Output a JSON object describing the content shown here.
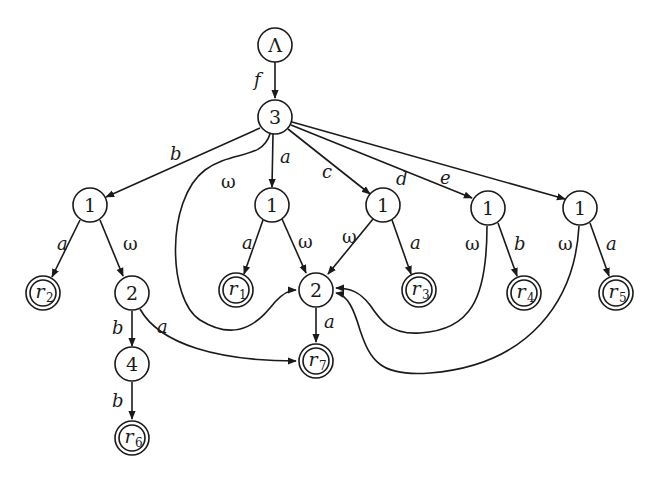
{
  "diagram": {
    "type": "automaton-tree",
    "nodes": [
      {
        "id": "root",
        "label": "Λ",
        "x": 275,
        "y": 45,
        "final": false
      },
      {
        "id": "n3",
        "label": "3",
        "x": 275,
        "y": 117,
        "final": false
      },
      {
        "id": "n1a",
        "label": "1",
        "x": 90,
        "y": 205,
        "final": false
      },
      {
        "id": "n1b",
        "label": "1",
        "x": 272,
        "y": 205,
        "final": false
      },
      {
        "id": "n1c",
        "label": "1",
        "x": 383,
        "y": 205,
        "final": false
      },
      {
        "id": "n1d",
        "label": "1",
        "x": 488,
        "y": 208,
        "final": false
      },
      {
        "id": "n1e",
        "label": "1",
        "x": 580,
        "y": 208,
        "final": false
      },
      {
        "id": "r2",
        "label": "r",
        "sub": "2",
        "x": 43,
        "y": 293,
        "final": true
      },
      {
        "id": "n2a",
        "label": "2",
        "x": 132,
        "y": 293,
        "final": false
      },
      {
        "id": "r1",
        "label": "r",
        "sub": "1",
        "x": 236,
        "y": 290,
        "final": true
      },
      {
        "id": "n2b",
        "label": "2",
        "x": 316,
        "y": 290,
        "final": false
      },
      {
        "id": "r3",
        "label": "r",
        "sub": "3",
        "x": 419,
        "y": 290,
        "final": true
      },
      {
        "id": "r4",
        "label": "r",
        "sub": "4",
        "x": 524,
        "y": 293,
        "final": true
      },
      {
        "id": "r5",
        "label": "r",
        "sub": "5",
        "x": 616,
        "y": 293,
        "final": true
      },
      {
        "id": "n4",
        "label": "4",
        "x": 132,
        "y": 364,
        "final": false
      },
      {
        "id": "r7",
        "label": "r",
        "sub": "7",
        "x": 316,
        "y": 361,
        "final": true
      },
      {
        "id": "r6",
        "label": "r",
        "sub": "6",
        "x": 132,
        "y": 438,
        "final": true
      }
    ],
    "edges": [
      {
        "from": "root",
        "to": "n3",
        "label": "f"
      },
      {
        "from": "n3",
        "to": "n1a",
        "label": "b"
      },
      {
        "from": "n3",
        "to": "n1b",
        "label": "a"
      },
      {
        "from": "n3",
        "to": "n1c",
        "label": "c"
      },
      {
        "from": "n3",
        "to": "n1d",
        "label": "d"
      },
      {
        "from": "n3",
        "to": "n1e",
        "label": "e"
      },
      {
        "from": "n3",
        "to": "n2b",
        "label": "ω"
      },
      {
        "from": "n1a",
        "to": "r2",
        "label": "a"
      },
      {
        "from": "n1a",
        "to": "n2a",
        "label": "ω"
      },
      {
        "from": "n1b",
        "to": "r1",
        "label": "a"
      },
      {
        "from": "n1b",
        "to": "n2b",
        "label": "ω"
      },
      {
        "from": "n1c",
        "to": "n2b",
        "label": "ω"
      },
      {
        "from": "n1c",
        "to": "r3",
        "label": "a"
      },
      {
        "from": "n1d",
        "to": "n2b",
        "label": "ω"
      },
      {
        "from": "n1d",
        "to": "r4",
        "label": "b"
      },
      {
        "from": "n1e",
        "to": "n2b",
        "label": "ω"
      },
      {
        "from": "n1e",
        "to": "r5",
        "label": "a"
      },
      {
        "from": "n2a",
        "to": "n4",
        "label": "b"
      },
      {
        "from": "n2a",
        "to": "r7",
        "label": "a"
      },
      {
        "from": "n2b",
        "to": "r7",
        "label": "a"
      },
      {
        "from": "n4",
        "to": "r6",
        "label": "b"
      }
    ]
  },
  "labels": {
    "f": "f",
    "b_top": "b",
    "a_top": "a",
    "c_top": "c",
    "d_top": "d",
    "e_top": "e",
    "omega_top": "ω",
    "n1a_a": "a",
    "n1a_w": "ω",
    "n1b_a": "a",
    "n1b_w": "ω",
    "n1c_w": "ω",
    "n1c_a": "a",
    "n1d_w": "ω",
    "n1d_b": "b",
    "n1e_w": "ω",
    "n1e_a": "a",
    "n2a_b": "b",
    "n2a_a": "a",
    "n2b_a": "a",
    "n4_b": "b"
  },
  "node_text": {
    "root": "Λ",
    "n3": "3",
    "n1a": "1",
    "n1b": "1",
    "n1c": "1",
    "n1d": "1",
    "n1e": "1",
    "n2a": "2",
    "n2b": "2",
    "n4": "4",
    "r": "r",
    "r1": "1",
    "r2": "2",
    "r3": "3",
    "r4": "4",
    "r5": "5",
    "r6": "6",
    "r7": "7"
  }
}
